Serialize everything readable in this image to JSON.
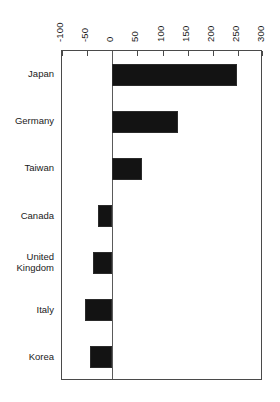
{
  "chart_data": {
    "type": "bar",
    "orientation": "horizontal",
    "title": "",
    "subtitle": "",
    "xlabel": "",
    "ylabel": "",
    "categories": [
      "Japan",
      "Germany",
      "Taiwan",
      "Canada",
      "United Kingdom",
      "Italy",
      "Korea"
    ],
    "category_labels_display": [
      "Japan",
      "Germany",
      "Taiwan",
      "Canada",
      "United\nKingdom",
      "Italy",
      "Korea"
    ],
    "values": [
      248,
      130,
      60,
      -28,
      -38,
      -54,
      -45
    ],
    "series": [
      {
        "name": "",
        "values": [
          248,
          130,
          60,
          -28,
          -38,
          -54,
          -45
        ]
      }
    ],
    "xlim": [
      -100,
      300
    ],
    "xticks": [
      -100,
      -50,
      0,
      50,
      100,
      150,
      200,
      250,
      300
    ],
    "xtick_labels": [
      "-100",
      "-50",
      "0",
      "50",
      "100",
      "150",
      "200",
      "250",
      "300"
    ],
    "xtick_label_rotation": 90,
    "grid": false,
    "legend": false,
    "legend_position": "none",
    "bar_color": "#131313",
    "axis_color": "#4a4a4a",
    "background_color": "#ffffff",
    "zero_reference_line": 0
  }
}
